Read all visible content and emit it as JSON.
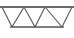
{
  "figure": {
    "name": "triangular-truss-diagram",
    "width": 74,
    "height": 38,
    "background_color": "#ffffff"
  },
  "style": {
    "line_color": "#555555",
    "chord_color": "#6a6a6a",
    "top_chord_width": 2.0,
    "bottom_chord_width": 1.6,
    "web_width": 1.1
  },
  "geometry": {
    "top_chord": {
      "x1": 1,
      "y1": 7,
      "x2": 73,
      "y2": 7
    },
    "bottom_chord": {
      "x1": 11,
      "y1": 27,
      "x2": 63,
      "y2": 27
    },
    "top_nodes": [
      {
        "id": "T0",
        "x": 2,
        "y": 7
      },
      {
        "id": "T1",
        "x": 24,
        "y": 7
      },
      {
        "id": "T2",
        "x": 45,
        "y": 7
      },
      {
        "id": "T3",
        "x": 72,
        "y": 7
      }
    ],
    "bottom_nodes": [
      {
        "id": "B0",
        "x": 12,
        "y": 27
      },
      {
        "id": "B1",
        "x": 35,
        "y": 27
      },
      {
        "id": "B2",
        "x": 62,
        "y": 27
      }
    ],
    "web_members": [
      {
        "from": "T0",
        "to": "B0"
      },
      {
        "from": "B0",
        "to": "T1"
      },
      {
        "from": "T1",
        "to": "B1"
      },
      {
        "from": "B1",
        "to": "T2"
      },
      {
        "from": "T2",
        "to": "B2"
      },
      {
        "from": "B2",
        "to": "T3"
      }
    ],
    "downward_triangles": 3,
    "upward_triangles": 2
  },
  "labels": {
    "top_chord": "top-chord",
    "bottom_chord": "bottom-chord",
    "web": "web-members"
  }
}
